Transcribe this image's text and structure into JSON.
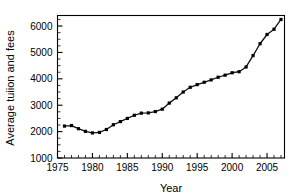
{
  "chart_data": {
    "type": "line",
    "title": "",
    "xlabel": "Year",
    "ylabel": "Average tuiion and fees",
    "xlim": [
      1975,
      2007.5
    ],
    "ylim": [
      1000,
      6400
    ],
    "grid": false,
    "legend": null,
    "marker": "filled-square",
    "line_color": "#000000",
    "marker_color": "#000000",
    "x_ticks": [
      1975,
      1980,
      1985,
      1990,
      1995,
      2000,
      2005
    ],
    "x_tick_labels": [
      "1975",
      "1980",
      "1985",
      "1990",
      "1995",
      "2000",
      "2005"
    ],
    "x_minor_tick_step": 1,
    "y_ticks": [
      1000,
      2000,
      3000,
      4000,
      5000,
      6000
    ],
    "y_tick_labels": [
      "1000",
      "2000",
      "3000",
      "4000",
      "5000",
      "6000"
    ],
    "y_minor_tick_step": 250,
    "x": [
      1976,
      1977,
      1978,
      1979,
      1980,
      1981,
      1982,
      1983,
      1984,
      1985,
      1986,
      1987,
      1988,
      1989,
      1990,
      1991,
      1992,
      1993,
      1994,
      1995,
      1996,
      1997,
      1998,
      1999,
      2000,
      2001,
      2002,
      2003,
      2004,
      2005,
      2006,
      2007
    ],
    "values": [
      2210,
      2230,
      2110,
      2010,
      1950,
      1970,
      2080,
      2260,
      2380,
      2500,
      2620,
      2700,
      2710,
      2760,
      2850,
      3080,
      3280,
      3500,
      3680,
      3780,
      3870,
      3960,
      4060,
      4140,
      4230,
      4270,
      4450,
      4880,
      5330,
      5680,
      5880,
      6250
    ],
    "series_name": "Average tuition and fees"
  },
  "axes": {
    "y_label_text": "Average tuiion and fees",
    "x_label_text": "Year"
  }
}
